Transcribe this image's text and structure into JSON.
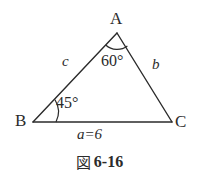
{
  "figure": {
    "type": "triangle-diagram",
    "background_color": "#ffffff",
    "stroke_color": "#2b2b2b",
    "vertices": {
      "A": {
        "label": "A",
        "x": 117,
        "y": 33
      },
      "B": {
        "label": "B",
        "x": 33,
        "y": 122
      },
      "C": {
        "label": "C",
        "x": 172,
        "y": 122
      }
    },
    "angles": {
      "at_A": "60°",
      "at_B": "45°"
    },
    "sides": {
      "side_b": "b",
      "side_c": "c",
      "side_a": "a=6"
    },
    "caption": {
      "mark": "図",
      "number": "6-16"
    }
  }
}
